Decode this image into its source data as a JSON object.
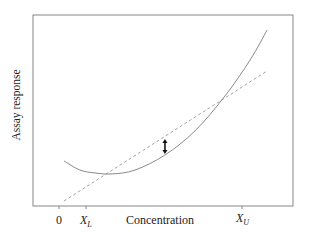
{
  "chart_data": {
    "type": "line",
    "title": "",
    "xlabel": "Concentration",
    "ylabel": "Assay response",
    "grid": false,
    "legend": null,
    "xlim": [
      -1.42,
      12.77
    ],
    "ylim": [
      0,
      10
    ],
    "x_ticks": [
      {
        "value": 0,
        "label": "0"
      },
      {
        "value": 1.5,
        "label": "X",
        "subscript": "L"
      },
      {
        "value": 10,
        "label": "X",
        "subscript": "U"
      }
    ],
    "series": [
      {
        "name": "True response curve",
        "style": "solid",
        "color": "#7d7d7d",
        "x": [
          0.27,
          1.15,
          1.97,
          2.9,
          4.15,
          5.79,
          7.43,
          9.07,
          10.44,
          11.37
        ],
        "y": [
          2.36,
          1.88,
          1.73,
          1.68,
          1.88,
          2.67,
          3.93,
          5.76,
          7.64,
          9.21
        ]
      },
      {
        "name": "Linear fit",
        "style": "dashed",
        "color": "#9a9a9a",
        "x": [
          0.27,
          11.37
        ],
        "y": [
          0.26,
          7.07
        ]
      }
    ],
    "annotations": [
      {
        "type": "double-arrow",
        "x": 5.79,
        "y_from": 2.72,
        "y_to": 3.51,
        "meaning": "deviation between linear fit and curve"
      }
    ]
  },
  "labels": {
    "xlabel": "Concentration",
    "ylabel": "Assay response",
    "tick_zero": "0",
    "tick_xl_main": "X",
    "tick_xl_sub": "L",
    "tick_xu_main": "X",
    "tick_xu_sub": "U"
  }
}
